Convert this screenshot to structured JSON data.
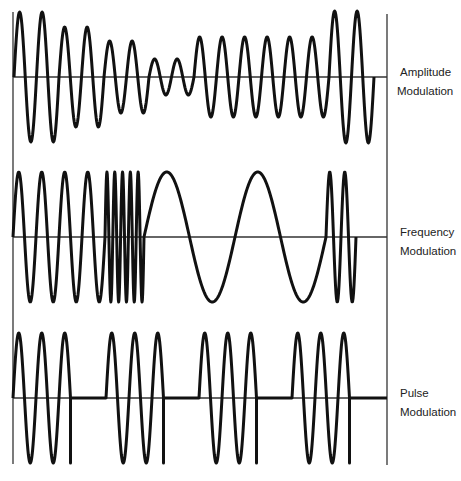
{
  "diagram": {
    "title": "",
    "colors": {
      "wave": "#111111",
      "axis": "#333333",
      "background": "#ffffff"
    },
    "frame": {
      "left_x": 13,
      "right_x": 387,
      "top_y": 12,
      "bottom_y": 464
    },
    "panels": [
      {
        "id": "am",
        "label_line1": "Amplitude",
        "label_line2": "Modulation",
        "baseline_y": 77,
        "type": "amplitude",
        "start_x": 14,
        "period": 22.5,
        "amplitudes": [
          65,
          65,
          50,
          50,
          36,
          36,
          18,
          18,
          40,
          40,
          40,
          40,
          40,
          40,
          66,
          66
        ]
      },
      {
        "id": "fm",
        "label_line1": "Frequency",
        "label_line2": "Modulation",
        "baseline_y": 237,
        "type": "frequency",
        "start_x": 13,
        "amplitude": 65,
        "segments": [
          {
            "cycles": 4,
            "period": 23
          },
          {
            "cycles": 5,
            "period": 7.8
          },
          {
            "cycles": 2,
            "period": 91
          },
          {
            "cycles": 2,
            "period": 15
          }
        ]
      },
      {
        "id": "pm",
        "label_line1": "Pulse",
        "label_line2": "Modulation",
        "baseline_y": 398,
        "type": "pulse",
        "amplitude": 65,
        "period": 23,
        "cycles_per_burst": 2,
        "burst_starts": [
          13,
          106,
          199,
          292
        ]
      }
    ]
  }
}
